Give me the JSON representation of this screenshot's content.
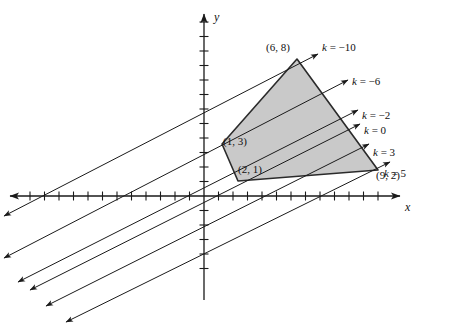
{
  "figure": {
    "type": "linear-programming-graph",
    "background": "#ffffff",
    "ink": "#1a1a1a",
    "region_fill": "#c9c9c9",
    "region_stroke": "#2b2b2b"
  },
  "axes": {
    "x_label": "x",
    "y_label": "y",
    "origin_px": {
      "x": 204,
      "y": 196
    },
    "unit_px": {
      "x": 15.5,
      "y": 17.0
    },
    "tick_spacing_px": 14.5,
    "x_range_px": {
      "from": 10,
      "to": 400
    },
    "y_range_px": {
      "from": 14,
      "to": 300
    }
  },
  "chart_data": {
    "type": "scatter",
    "title": "",
    "xlabel": "x",
    "ylabel": "y",
    "grid": false,
    "legend": "none",
    "feasible_region": {
      "name": "shaded-feasible-region",
      "fill": "#c9c9c9",
      "vertices": [
        {
          "x": 1,
          "y": 3,
          "label": "(1, 3)",
          "px": {
            "x": 222,
            "y": 144
          }
        },
        {
          "x": 6,
          "y": 8,
          "label": "(6, 8)",
          "px": {
            "x": 297,
            "y": 59
          }
        },
        {
          "x": 9,
          "y": 2,
          "label": "(9, 2)",
          "px": {
            "x": 378,
            "y": 170
          }
        },
        {
          "x": 2,
          "y": 1,
          "label": "(2, 1)",
          "px": {
            "x": 238,
            "y": 181
          }
        }
      ]
    },
    "objective_lines": {
      "slope": 0.5,
      "arrowheads": "both-ends",
      "items": [
        {
          "k": -10,
          "label": "k = −10",
          "label_px": {
            "x": 322,
            "y": 42
          },
          "p1": {
            "x": 4,
            "y": 216
          },
          "p2": {
            "x": 318,
            "y": 54
          }
        },
        {
          "k": -6,
          "label": "k = −6",
          "label_px": {
            "x": 352,
            "y": 76
          },
          "p1": {
            "x": 4,
            "y": 258
          },
          "p2": {
            "x": 348,
            "y": 80
          }
        },
        {
          "k": -2,
          "label": "k = −2",
          "label_px": {
            "x": 362,
            "y": 110
          },
          "p1": {
            "x": 18,
            "y": 282
          },
          "p2": {
            "x": 358,
            "y": 110
          }
        },
        {
          "k": 0,
          "label": "k = 0",
          "label_px": {
            "x": 364,
            "y": 125
          },
          "p1": {
            "x": 30,
            "y": 290
          },
          "p2": {
            "x": 360,
            "y": 124
          }
        },
        {
          "k": 3,
          "label": "k = 3",
          "label_px": {
            "x": 373,
            "y": 147
          },
          "p1": {
            "x": 46,
            "y": 306
          },
          "p2": {
            "x": 369,
            "y": 144
          }
        },
        {
          "k": 5,
          "label": "k = 5",
          "label_px": {
            "x": 384,
            "y": 168
          },
          "p1": {
            "x": 66,
            "y": 322
          },
          "p2": {
            "x": 390,
            "y": 162
          }
        }
      ]
    },
    "point_labels": [
      {
        "text": "(6, 8)",
        "px": {
          "x": 266,
          "y": 42
        }
      },
      {
        "text": "(1, 3)",
        "px": {
          "x": 223,
          "y": 136
        }
      },
      {
        "text": "(2, 1)",
        "px": {
          "x": 238,
          "y": 164
        }
      },
      {
        "text": "(9, 2)",
        "px": {
          "x": 376,
          "y": 170
        }
      }
    ]
  }
}
